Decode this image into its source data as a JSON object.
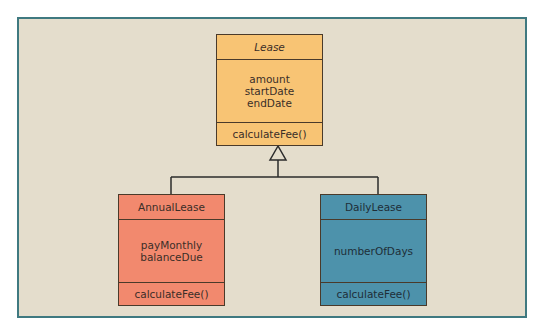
{
  "diagram": {
    "type": "uml-class-inheritance",
    "colors": {
      "frame_background": "#e4ddcc",
      "frame_border": "#3f7980",
      "parent_fill": "#f8c474",
      "annual_fill": "#f2896e",
      "daily_fill": "#4d92ab",
      "line": "#2b2b2b"
    },
    "parent": {
      "name": "Lease",
      "abstract": true,
      "attributes": [
        "amount",
        "startDate",
        "endDate"
      ],
      "methods": [
        "calculateFee()"
      ]
    },
    "children": [
      {
        "name": "AnnualLease",
        "attributes": [
          "payMonthly",
          "balanceDue"
        ],
        "methods": [
          "calculateFee()"
        ]
      },
      {
        "name": "DailyLease",
        "attributes": [
          "numberOfDays"
        ],
        "methods": [
          "calculateFee()"
        ]
      }
    ],
    "relationship": "generalization"
  }
}
